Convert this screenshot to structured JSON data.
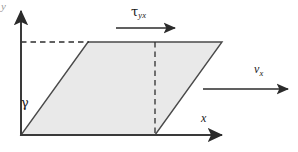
{
  "figure": {
    "type": "shear-deformation-diagram",
    "title": "",
    "background_color": "#ffffff",
    "width": 298,
    "height": 152
  },
  "axes": {
    "x_label": "x",
    "y_label": "y",
    "origin": {
      "x": 21,
      "y": 135
    },
    "x_axis": {
      "start_x": 21,
      "end_x": 225,
      "y": 135
    },
    "y_axis": {
      "x": 21,
      "start_y": 135,
      "end_y": 8
    },
    "stroke_color": "#3a3a3a"
  },
  "shape": {
    "name": "sheared-parallelogram",
    "fill_color": "#e9e9e9",
    "stroke_color": "#4a4a4a",
    "points": "21,135 155,135 222,42 88,42",
    "vertices": [
      {
        "label": "bottom-left",
        "x": 21,
        "y": 135
      },
      {
        "label": "bottom-right",
        "x": 155,
        "y": 135
      },
      {
        "label": "top-right",
        "x": 222,
        "y": 42
      },
      {
        "label": "top-left",
        "x": 88,
        "y": 42
      }
    ]
  },
  "guides": {
    "dashed_color": "#2e2e2e",
    "horizontal": {
      "x1": 21,
      "y1": 42,
      "x2": 88,
      "y2": 42
    },
    "vertical": {
      "x1": 155,
      "y1": 42,
      "x2": 155,
      "y2": 135
    }
  },
  "annotations": {
    "shear_stress": {
      "label": "τ",
      "subscript": "yx",
      "arrow": {
        "x1": 116,
        "y1": 28,
        "x2": 178,
        "y2": 28
      },
      "label_position": {
        "x": 131,
        "y": 5
      }
    },
    "velocity": {
      "label": "v",
      "subscript": "x",
      "arrow": {
        "x1": 203,
        "y1": 89,
        "x2": 291,
        "y2": 89
      },
      "label_position": {
        "x": 254,
        "y": 63
      }
    },
    "shear_strain": {
      "label": "γ",
      "label_position": {
        "x": 21,
        "y": 96
      }
    }
  },
  "colors": {
    "ink": "#1a1a1a",
    "shape_fill": "#e9e9e9",
    "shape_stroke": "#4a4a4a",
    "axis": "#3a3a3a",
    "faint_text": "#9a9a9a"
  }
}
